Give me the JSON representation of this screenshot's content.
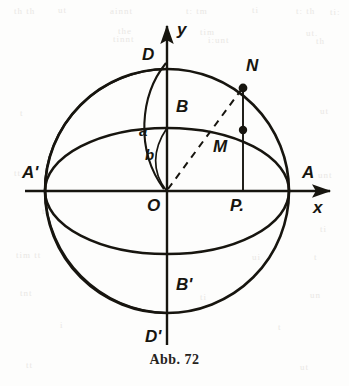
{
  "figure": {
    "caption": "Abb. 72",
    "caption_top": 352,
    "background_color": "#fdfdfc",
    "ink_color": "#17150f",
    "geometry": {
      "center": {
        "x": 167,
        "y": 191
      },
      "circle_radius": 122,
      "ellipse_semi_major": 122,
      "ellipse_semi_minor": 63,
      "ordinate_line_x": 243,
      "point_N": {
        "x": 243,
        "y": 88
      },
      "point_M": {
        "x": 243,
        "y": 130
      },
      "point_P": {
        "x": 243,
        "y": 191
      }
    },
    "axes": {
      "x_axis": {
        "label": "x",
        "x1": 25,
        "x2": 335,
        "y": 191
      },
      "y_axis": {
        "label": "y",
        "y1": 22,
        "y2": 345,
        "x": 167
      }
    },
    "labels": [
      {
        "name": "y-axis-label",
        "text": "y",
        "x": 177,
        "y": 20,
        "size": 17
      },
      {
        "name": "x-axis-label",
        "text": "x",
        "x": 313,
        "y": 198,
        "size": 17
      },
      {
        "name": "point-label-D",
        "text": "D",
        "x": 142,
        "y": 45,
        "size": 17
      },
      {
        "name": "point-label-N",
        "text": "N",
        "x": 246,
        "y": 56,
        "size": 17
      },
      {
        "name": "point-label-B",
        "text": "B",
        "x": 176,
        "y": 97,
        "size": 17
      },
      {
        "name": "arc-label-a",
        "text": "a",
        "x": 139,
        "y": 122,
        "size": 15
      },
      {
        "name": "point-label-M",
        "text": "M",
        "x": 213,
        "y": 137,
        "size": 17
      },
      {
        "name": "arc-label-b",
        "text": "b",
        "x": 145,
        "y": 146,
        "size": 15
      },
      {
        "name": "point-label-A-prime",
        "text": "A'",
        "x": 22,
        "y": 163,
        "size": 17
      },
      {
        "name": "point-label-A",
        "text": "A",
        "x": 302,
        "y": 163,
        "size": 17
      },
      {
        "name": "point-label-O",
        "text": "O",
        "x": 147,
        "y": 196,
        "size": 17
      },
      {
        "name": "point-label-P",
        "text": "P.",
        "x": 230,
        "y": 196,
        "size": 17
      },
      {
        "name": "point-label-B-prime",
        "text": "B'",
        "x": 176,
        "y": 275,
        "size": 17
      },
      {
        "name": "point-label-D-prime",
        "text": "D'",
        "x": 145,
        "y": 327,
        "size": 17
      }
    ],
    "bleed_text": [
      {
        "text": "th  th",
        "x": 14,
        "y": 6
      },
      {
        "text": "ut",
        "x": 58,
        "y": 5
      },
      {
        "text": "ainnt",
        "x": 110,
        "y": 6
      },
      {
        "text": "t: tm",
        "x": 186,
        "y": 6
      },
      {
        "text": "ti",
        "x": 252,
        "y": 5
      },
      {
        "text": "t: th",
        "x": 296,
        "y": 6
      },
      {
        "text": "ti:",
        "x": 330,
        "y": 7
      },
      {
        "text": "the",
        "x": 118,
        "y": 26
      },
      {
        "text": "tim",
        "x": 200,
        "y": 27
      },
      {
        "text": "ut.",
        "x": 306,
        "y": 28
      },
      {
        "text": "tinnt",
        "x": 113,
        "y": 34
      },
      {
        "text": "i:unt",
        "x": 208,
        "y": 35
      },
      {
        "text": "th",
        "x": 316,
        "y": 36
      },
      {
        "text": "t",
        "x": 20,
        "y": 108
      },
      {
        "text": "ut",
        "x": 320,
        "y": 106
      },
      {
        "text": "tt",
        "x": 14,
        "y": 168
      },
      {
        "text": "unt",
        "x": 318,
        "y": 170
      },
      {
        "text": "t",
        "x": 42,
        "y": 206
      },
      {
        "text": "ti",
        "x": 320,
        "y": 224
      },
      {
        "text": "tim  tt",
        "x": 16,
        "y": 250
      },
      {
        "text": "ui",
        "x": 252,
        "y": 252
      },
      {
        "text": "t",
        "x": 314,
        "y": 252
      },
      {
        "text": "tnt",
        "x": 20,
        "y": 288
      },
      {
        "text": "ti",
        "x": 200,
        "y": 292
      },
      {
        "text": "un",
        "x": 310,
        "y": 290
      },
      {
        "text": "i",
        "x": 60,
        "y": 320
      },
      {
        "text": "t",
        "x": 278,
        "y": 322
      },
      {
        "text": "tt",
        "x": 26,
        "y": 360
      },
      {
        "text": "ut",
        "x": 300,
        "y": 362
      }
    ]
  }
}
